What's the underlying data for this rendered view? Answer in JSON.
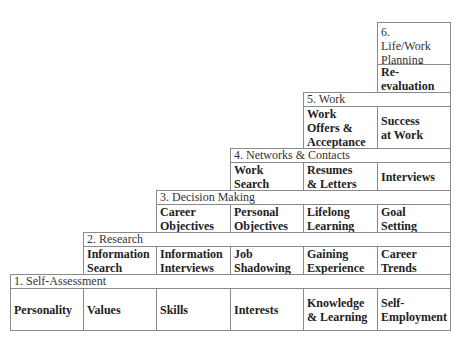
{
  "diagram": {
    "type": "staircase",
    "levels": [
      {
        "number": 1,
        "header": "1.  Self-Assessment",
        "items": [
          "Personality",
          "Values",
          "Skills",
          "Interests",
          "Knowledge & Learning",
          "Self-Employment"
        ]
      },
      {
        "number": 2,
        "header": "2.  Research",
        "items": [
          "Information Search",
          "Information Interviews",
          "Job Shadowing",
          "Gaining Experience",
          "Career Trends"
        ]
      },
      {
        "number": 3,
        "header": "3.  Decision Making",
        "items": [
          "Career Objectives",
          "Personal Objectives",
          "Lifelong Learning",
          "Goal Setting"
        ]
      },
      {
        "number": 4,
        "header": "4.  Networks & Contacts",
        "items": [
          "Work Search",
          "Resumes & Letters",
          "Interviews"
        ]
      },
      {
        "number": 5,
        "header": "5.  Work",
        "items": [
          "Work Offers & Acceptance",
          "Success at Work"
        ]
      },
      {
        "number": 6,
        "header": "6. Life/Work Planning",
        "items": [
          "Re-evaluation"
        ]
      }
    ]
  },
  "labels": {
    "l1h": "1.  Self-Assessment",
    "l1_0": "Personality",
    "l1_1": "Values",
    "l1_2": "Skills",
    "l1_3": "Interests",
    "l1_4a": "Knowledge",
    "l1_4b": "& Learning",
    "l1_5a": "Self-",
    "l1_5b": "Employment",
    "l2h": "2.  Research",
    "l2_0a": "Information",
    "l2_0b": "Search",
    "l2_1a": "Information",
    "l2_1b": "Interviews",
    "l2_2a": "Job",
    "l2_2b": "Shadowing",
    "l2_3a": "Gaining",
    "l2_3b": "Experience",
    "l2_4a": "Career",
    "l2_4b": "Trends",
    "l3h": "3.  Decision Making",
    "l3_0a": "Career",
    "l3_0b": "Objectives",
    "l3_1a": "Personal",
    "l3_1b": "Objectives",
    "l3_2a": "Lifelong",
    "l3_2b": "Learning",
    "l3_3a": "Goal",
    "l3_3b": "Setting",
    "l4h": "4.  Networks & Contacts",
    "l4_0a": "Work",
    "l4_0b": "Search",
    "l4_1a": "Resumes",
    "l4_1b": "& Letters",
    "l4_2": "Interviews",
    "l5h": "5.  Work",
    "l5_0a": "Work",
    "l5_0b": "Offers &",
    "l5_0c": "Acceptance",
    "l5_1a": "Success",
    "l5_1b": "at Work",
    "l6h_a": "6.",
    "l6h_b": "Life/Work",
    "l6h_c": "Planning",
    "l6_0a": "Re-",
    "l6_0b": "evaluation"
  }
}
